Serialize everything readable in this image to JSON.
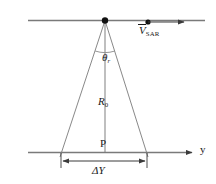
{
  "figure": {
    "kind": "sar-imaging-geometry-diagram",
    "background_color": "#ffffff",
    "line_color": "#6e6e6e",
    "text_color": "#1a1a1a"
  },
  "labels": {
    "velocity": {
      "symbol": "V",
      "subscript": "SAR",
      "accent": "overbar",
      "name": "sar-platform-velocity"
    },
    "look_angle": {
      "symbol": "θ",
      "subscript": "r",
      "name": "beam-look-angle"
    },
    "slant_range": {
      "symbol": "R",
      "subscript": "0",
      "name": "nominal-slant-range"
    },
    "target_point": {
      "symbol": "P",
      "name": "ground-target-point"
    },
    "swath_width": {
      "symbol": "ΔY",
      "name": "ground-swath-width"
    },
    "axis": {
      "symbol": "y",
      "name": "ground-range-axis"
    }
  },
  "geometry": {
    "flight_line": {
      "x1": 28,
      "y1": 20,
      "x2": 205,
      "y2": 20
    },
    "ground_line": {
      "x1": 28,
      "y1": 152,
      "x2": 196,
      "y2": 152
    },
    "apex": {
      "x": 105,
      "y": 20,
      "radius": 3.1
    },
    "platform_dot": {
      "x": 148,
      "y": 22,
      "radius": 2.6
    },
    "velocity_arrow": {
      "x1": 148,
      "y1": 22,
      "x2": 186,
      "y2": 22
    },
    "axis_arrow": {
      "x1": 185,
      "y1": 152,
      "x2": 198,
      "y2": 152
    },
    "beam_left_edge": {
      "x1": 105,
      "y1": 20,
      "x2": 60,
      "y2": 157
    },
    "beam_right_edge": {
      "x1": 105,
      "y1": 20,
      "x2": 148,
      "y2": 157
    },
    "center_line": {
      "x1": 105,
      "y1": 20,
      "x2": 105,
      "y2": 152
    },
    "angle_arc": {
      "cx": 105,
      "cy": 20,
      "r": 32,
      "start_deg": 252,
      "end_deg": 288
    },
    "swath_dim_line": {
      "y": 160,
      "x1": 61,
      "x2": 147
    },
    "swath_ticks": [
      {
        "x": 61,
        "y1": 152,
        "y2": 168
      },
      {
        "x": 147,
        "y1": 152,
        "y2": 168
      }
    ]
  }
}
